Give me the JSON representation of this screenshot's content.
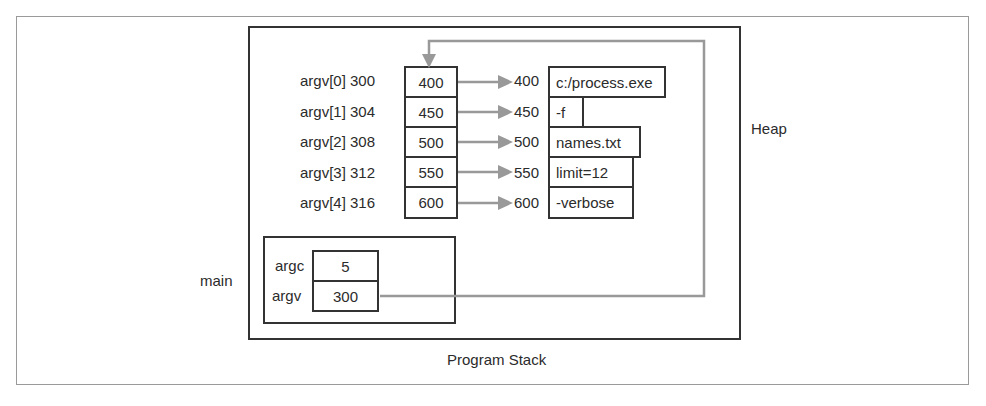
{
  "diagram": {
    "labels": {
      "heap": "Heap",
      "program_stack": "Program Stack",
      "main": "main"
    },
    "main_frame": {
      "vars": [
        {
          "name": "argc",
          "value": "5"
        },
        {
          "name": "argv",
          "value": "300"
        }
      ]
    },
    "argv_array": [
      {
        "label": "argv[0] 300",
        "pointer": "400",
        "target_addr": "400",
        "string": "c:/process.exe"
      },
      {
        "label": "argv[1] 304",
        "pointer": "450",
        "target_addr": "450",
        "string": "-f"
      },
      {
        "label": "argv[2] 308",
        "pointer": "500",
        "target_addr": "500",
        "string": "names.txt"
      },
      {
        "label": "argv[3] 312",
        "pointer": "550",
        "target_addr": "550",
        "string": "limit=12"
      },
      {
        "label": "argv[4] 316",
        "pointer": "600",
        "target_addr": "600",
        "string": "-verbose"
      }
    ],
    "colors": {
      "box_border": "#333333",
      "arrow": "#999999",
      "frame_border": "#9a9a9a"
    }
  }
}
